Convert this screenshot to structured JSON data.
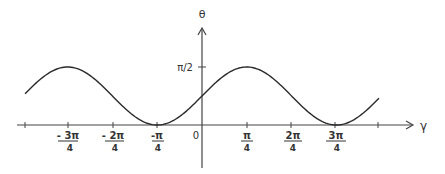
{
  "chart_data": {
    "type": "line",
    "title": "",
    "xlabel": "γ",
    "ylabel": "θ",
    "function": "θ = π/4 + (π/4)·sin(2γ)",
    "x_ticks": [
      {
        "value": -2.356,
        "num": "- 3π",
        "den": "4"
      },
      {
        "value": -1.571,
        "num": "- 2π",
        "den": "4"
      },
      {
        "value": -0.785,
        "num": "-π",
        "den": "4"
      },
      {
        "value": 0,
        "num": "0",
        "den": ""
      },
      {
        "value": 0.785,
        "num": "π",
        "den": "4"
      },
      {
        "value": 1.571,
        "num": "2π",
        "den": "4"
      },
      {
        "value": 2.356,
        "num": "3π",
        "den": "4"
      }
    ],
    "y_ticks": [
      {
        "value": 1.571,
        "label": "π/2"
      }
    ],
    "x": [
      -3.14,
      -2.356,
      -1.571,
      -0.785,
      0,
      0.785,
      1.571,
      2.356,
      3.14
    ],
    "series": [
      {
        "name": "θ(γ)",
        "values": [
          0.785,
          1.571,
          0.785,
          0,
          0.785,
          1.571,
          0.785,
          0,
          0.785
        ]
      }
    ],
    "xlim": [
      -3.14,
      3.14
    ],
    "ylim": [
      0,
      1.571
    ],
    "grid": false,
    "legend": "none",
    "annotations": []
  },
  "labels": {
    "y_axis": "θ",
    "x_axis": "γ",
    "y_tick_pi_half": "π/2",
    "origin": "0"
  },
  "colors": {
    "line": "#2a2a2a",
    "axis": "#444444",
    "text": "#333333"
  }
}
